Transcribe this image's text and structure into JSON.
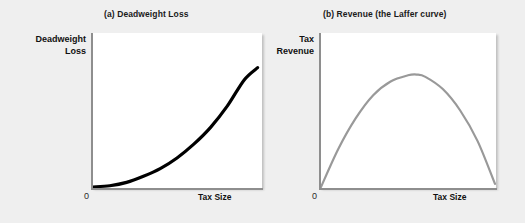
{
  "figure": {
    "background_color": "#efefef",
    "panels": [
      {
        "id": "a",
        "title": "(a) Deadweight Loss",
        "ylabel_line1": "Deadweight",
        "ylabel_line2": "Loss",
        "xlabel": "Tax Size",
        "origin_label": "0",
        "curve_color": "#000000"
      },
      {
        "id": "b",
        "title": "(b) Revenue (the Laffer curve)",
        "ylabel_line1": "Tax",
        "ylabel_line2": "Revenue",
        "xlabel": "Tax Size",
        "origin_label": "0",
        "curve_color": "#999999"
      }
    ]
  },
  "chart_data": [
    {
      "type": "line",
      "title": "(a) Deadweight Loss",
      "xlabel": "Tax Size",
      "ylabel": "Deadweight Loss",
      "xlim": [
        0,
        1
      ],
      "ylim": [
        0,
        1
      ],
      "grid": false,
      "legend": "none",
      "line_color": "#000000",
      "annotations": [
        "0"
      ],
      "description": "Convex increasing curve: deadweight loss rises more than proportionately with tax size",
      "x": [
        0,
        0.1,
        0.2,
        0.3,
        0.4,
        0.5,
        0.6,
        0.7,
        0.8,
        0.9,
        0.98
      ],
      "values": [
        0,
        0.008,
        0.03,
        0.07,
        0.12,
        0.19,
        0.28,
        0.39,
        0.53,
        0.7,
        0.78
      ]
    },
    {
      "type": "line",
      "title": "(b) Revenue (the Laffer curve)",
      "xlabel": "Tax Size",
      "ylabel": "Tax Revenue",
      "xlim": [
        0,
        1
      ],
      "ylim": [
        0,
        1
      ],
      "grid": false,
      "legend": "none",
      "line_color": "#999999",
      "annotations": [
        "0"
      ],
      "description": "Inverted-U Laffer curve: tax revenue rises, peaks at an intermediate tax size, then falls to zero",
      "x": [
        0,
        0.1,
        0.2,
        0.3,
        0.4,
        0.5,
        0.55,
        0.6,
        0.7,
        0.8,
        0.9,
        1.0
      ],
      "values": [
        0,
        0.25,
        0.45,
        0.6,
        0.69,
        0.73,
        0.735,
        0.72,
        0.64,
        0.5,
        0.3,
        0.02
      ]
    }
  ]
}
